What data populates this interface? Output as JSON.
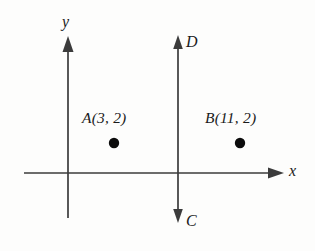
{
  "figure": {
    "background_color": "#fdfdfc",
    "stroke_color": "#3b3b3b",
    "dot_color": "#0c0c0c",
    "width": 315,
    "height": 251
  },
  "axes": {
    "x_axis": {
      "label": "x",
      "label_x": 289,
      "label_y": 163,
      "y": 173,
      "x_start": 24,
      "x_end": 275,
      "arrow_tip_x": 284,
      "arrow": "right"
    },
    "y_axis": {
      "label": "y",
      "label_x": 62,
      "label_y": 14,
      "x": 68,
      "y_start": 42,
      "y_end": 218,
      "arrow_tip_y": 36,
      "arrow": "up"
    }
  },
  "vertical_line": {
    "name": "line-CD",
    "x": 178,
    "y_top": 42,
    "y_bottom": 216,
    "top_arrow_tip_y": 35,
    "bottom_arrow_tip_y": 223,
    "top_label": "D",
    "top_label_x": 186,
    "top_label_y": 34,
    "bottom_label": "C",
    "bottom_label_x": 186,
    "bottom_label_y": 213
  },
  "points": [
    {
      "name": "point-a",
      "label": "A(3, 2)",
      "label_x": 82,
      "label_y": 110,
      "dot_x": 114,
      "dot_y": 143,
      "dot_r": 5.2,
      "coordinates": {
        "x": 3,
        "y": 2
      }
    },
    {
      "name": "point-b",
      "label": "B(11, 2)",
      "label_x": 205,
      "label_y": 110,
      "dot_x": 240,
      "dot_y": 143,
      "dot_r": 5.2,
      "coordinates": {
        "x": 11,
        "y": 2
      }
    }
  ]
}
